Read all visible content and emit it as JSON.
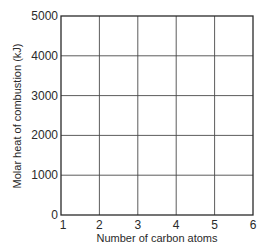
{
  "chart_data": {
    "type": "line",
    "title": "",
    "xlabel": "Number of carbon atoms",
    "ylabel": "Molar heat of combustion (kJ)",
    "x_ticks": [
      1,
      2,
      3,
      4,
      5,
      6
    ],
    "y_ticks": [
      0,
      1000,
      2000,
      3000,
      4000,
      5000
    ],
    "x_tick_labels": [
      "1",
      "2",
      "3",
      "4",
      "5",
      "6"
    ],
    "y_tick_labels": [
      "0",
      "1000",
      "2000",
      "3000",
      "4000",
      "5000"
    ],
    "xlim": [
      1,
      6
    ],
    "ylim": [
      0,
      5000
    ],
    "grid": true,
    "legend": null,
    "series": [],
    "note": "Blank graph grid with no plotted data"
  },
  "colors": {
    "axis": "#2a2a2a",
    "grid": "#4a4a4a",
    "background": "#ffffff"
  }
}
